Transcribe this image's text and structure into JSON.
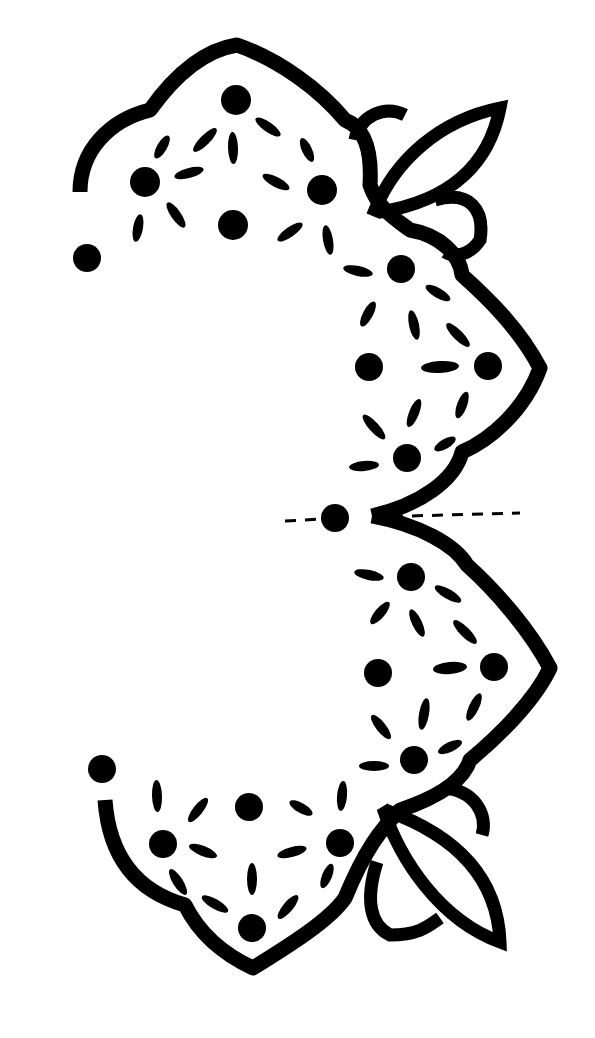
{
  "pattern": {
    "type": "cutwork-embroidery-pattern",
    "colors": {
      "ink": "#000000",
      "paper": "#ffffff"
    },
    "fold_line": {
      "style": "dashed",
      "y": 516
    },
    "center_dot": {
      "cx": 335,
      "cy": 518,
      "r": 14
    },
    "dots": [
      {
        "cx": 87,
        "cy": 258,
        "r": 14
      },
      {
        "cx": 236,
        "cy": 100,
        "r": 15
      },
      {
        "cx": 145,
        "cy": 182,
        "r": 15
      },
      {
        "cx": 322,
        "cy": 190,
        "r": 15
      },
      {
        "cx": 233,
        "cy": 225,
        "r": 15
      },
      {
        "cx": 401,
        "cy": 269,
        "r": 14
      },
      {
        "cx": 369,
        "cy": 367,
        "r": 14
      },
      {
        "cx": 488,
        "cy": 366,
        "r": 14
      },
      {
        "cx": 407,
        "cy": 458,
        "r": 14
      },
      {
        "cx": 411,
        "cy": 577,
        "r": 14
      },
      {
        "cx": 378,
        "cy": 673,
        "r": 14
      },
      {
        "cx": 494,
        "cy": 667,
        "r": 14
      },
      {
        "cx": 414,
        "cy": 760,
        "r": 14
      },
      {
        "cx": 102,
        "cy": 769,
        "r": 14
      },
      {
        "cx": 249,
        "cy": 807,
        "r": 14
      },
      {
        "cx": 163,
        "cy": 844,
        "r": 14
      },
      {
        "cx": 340,
        "cy": 843,
        "r": 14
      },
      {
        "cx": 252,
        "cy": 928,
        "r": 14
      }
    ],
    "petals": [
      {
        "cx": 205,
        "cy": 140,
        "rx": 16,
        "ry": 5,
        "rot": -45
      },
      {
        "cx": 268,
        "cy": 127,
        "rx": 15,
        "ry": 5,
        "rot": 35
      },
      {
        "cx": 233,
        "cy": 148,
        "rx": 16,
        "ry": 5,
        "rot": 88
      },
      {
        "cx": 162,
        "cy": 147,
        "rx": 13,
        "ry": 5,
        "rot": -60
      },
      {
        "cx": 307,
        "cy": 150,
        "rx": 13,
        "ry": 5,
        "rot": 65
      },
      {
        "cx": 189,
        "cy": 173,
        "rx": 15,
        "ry": 5,
        "rot": -15
      },
      {
        "cx": 276,
        "cy": 182,
        "rx": 15,
        "ry": 5,
        "rot": 28
      },
      {
        "cx": 138,
        "cy": 228,
        "rx": 14,
        "ry": 5,
        "rot": -80
      },
      {
        "cx": 176,
        "cy": 215,
        "rx": 15,
        "ry": 5,
        "rot": 55
      },
      {
        "cx": 290,
        "cy": 232,
        "rx": 15,
        "ry": 5,
        "rot": -35
      },
      {
        "cx": 328,
        "cy": 240,
        "rx": 15,
        "ry": 5,
        "rot": 80
      },
      {
        "cx": 358,
        "cy": 271,
        "rx": 15,
        "ry": 5,
        "rot": 12
      },
      {
        "cx": 438,
        "cy": 293,
        "rx": 14,
        "ry": 5,
        "rot": 30
      },
      {
        "cx": 368,
        "cy": 314,
        "rx": 14,
        "ry": 5,
        "rot": -62
      },
      {
        "cx": 414,
        "cy": 325,
        "rx": 15,
        "ry": 5,
        "rot": 78
      },
      {
        "cx": 458,
        "cy": 335,
        "rx": 16,
        "ry": 5,
        "rot": 45
      },
      {
        "cx": 440,
        "cy": 367,
        "rx": 19,
        "ry": 6,
        "rot": -3
      },
      {
        "cx": 414,
        "cy": 413,
        "rx": 15,
        "ry": 5,
        "rot": -68
      },
      {
        "cx": 462,
        "cy": 405,
        "rx": 14,
        "ry": 5,
        "rot": -70
      },
      {
        "cx": 374,
        "cy": 427,
        "rx": 16,
        "ry": 5,
        "rot": 48
      },
      {
        "cx": 445,
        "cy": 444,
        "rx": 12,
        "ry": 5,
        "rot": -30
      },
      {
        "cx": 364,
        "cy": 466,
        "rx": 15,
        "ry": 5,
        "rot": -5
      },
      {
        "cx": 369,
        "cy": 575,
        "rx": 15,
        "ry": 5,
        "rot": 12
      },
      {
        "cx": 448,
        "cy": 594,
        "rx": 15,
        "ry": 5,
        "rot": 30
      },
      {
        "cx": 380,
        "cy": 613,
        "rx": 14,
        "ry": 5,
        "rot": -50
      },
      {
        "cx": 417,
        "cy": 623,
        "rx": 15,
        "ry": 5,
        "rot": 65
      },
      {
        "cx": 465,
        "cy": 632,
        "rx": 16,
        "ry": 5,
        "rot": 45
      },
      {
        "cx": 450,
        "cy": 668,
        "rx": 17,
        "ry": 6,
        "rot": -5
      },
      {
        "cx": 424,
        "cy": 714,
        "rx": 16,
        "ry": 5,
        "rot": -80
      },
      {
        "cx": 474,
        "cy": 707,
        "rx": 15,
        "ry": 5,
        "rot": -65
      },
      {
        "cx": 381,
        "cy": 727,
        "rx": 15,
        "ry": 5,
        "rot": 52
      },
      {
        "cx": 450,
        "cy": 747,
        "rx": 13,
        "ry": 5,
        "rot": -25
      },
      {
        "cx": 374,
        "cy": 766,
        "rx": 15,
        "ry": 5,
        "rot": 0
      },
      {
        "cx": 157,
        "cy": 796,
        "rx": 16,
        "ry": 5,
        "rot": 88
      },
      {
        "cx": 198,
        "cy": 810,
        "rx": 15,
        "ry": 5,
        "rot": -52
      },
      {
        "cx": 301,
        "cy": 808,
        "rx": 13,
        "ry": 5,
        "rot": 30
      },
      {
        "cx": 342,
        "cy": 796,
        "rx": 15,
        "ry": 5,
        "rot": -85
      },
      {
        "cx": 203,
        "cy": 851,
        "rx": 15,
        "ry": 5,
        "rot": 22
      },
      {
        "cx": 292,
        "cy": 852,
        "rx": 15,
        "ry": 5,
        "rot": -15
      },
      {
        "cx": 178,
        "cy": 882,
        "rx": 15,
        "ry": 5,
        "rot": 58
      },
      {
        "cx": 252,
        "cy": 879,
        "rx": 16,
        "ry": 5,
        "rot": 90
      },
      {
        "cx": 327,
        "cy": 876,
        "rx": 13,
        "ry": 5,
        "rot": -68
      },
      {
        "cx": 215,
        "cy": 904,
        "rx": 15,
        "ry": 5,
        "rot": 30
      },
      {
        "cx": 288,
        "cy": 907,
        "rx": 15,
        "ry": 5,
        "rot": -50
      }
    ]
  }
}
